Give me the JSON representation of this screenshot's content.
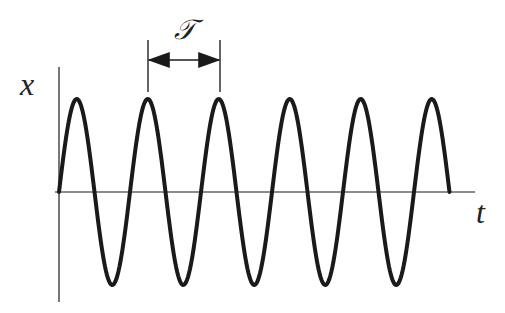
{
  "diagram": {
    "y_axis_label": "x",
    "x_axis_label": "t",
    "period_label": "𝒯",
    "colors": {
      "curve": "#1a1a1a",
      "axis": "#555555",
      "background": "#ffffff"
    }
  },
  "chart_data": {
    "type": "line",
    "title": "",
    "xlabel": "t",
    "ylabel": "x",
    "periods_shown": 5.5,
    "amplitude": 1,
    "grid": false
  }
}
